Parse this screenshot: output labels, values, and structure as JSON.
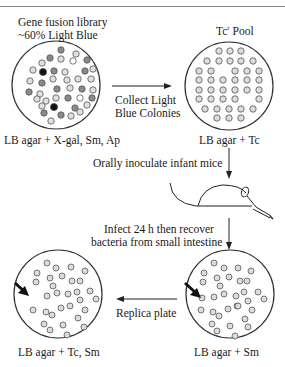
{
  "figure": {
    "top_rule": true,
    "labels": {
      "library_title_line1": "Gene fusion library",
      "library_title_line2": "~60% Light Blue",
      "pool_title": "Tc",
      "pool_title_sup": "r",
      "pool_title_rest": " Pool",
      "plate1_media": "LB agar + X-gal, Sm, Ap",
      "plate2_media": "LB agar + Tc",
      "step1_line1": "Collect Light",
      "step1_line2": "Blue Colonies",
      "step2": "Orally inoculate infant mice",
      "step3_line1": "Infect 24 h then recover",
      "step3_line2": "bacteria from small intestine",
      "step4": "Replica plate",
      "plate3_media": "LB agar + Sm",
      "plate4_media": "LB agar + Tc, Sm"
    },
    "colors": {
      "light_blue_colony": "#d8d8d8",
      "blue_colony": "#8a8a8a",
      "dark_colony": "#111111",
      "white_colony": "#ffffff",
      "outline": "#333333"
    }
  }
}
